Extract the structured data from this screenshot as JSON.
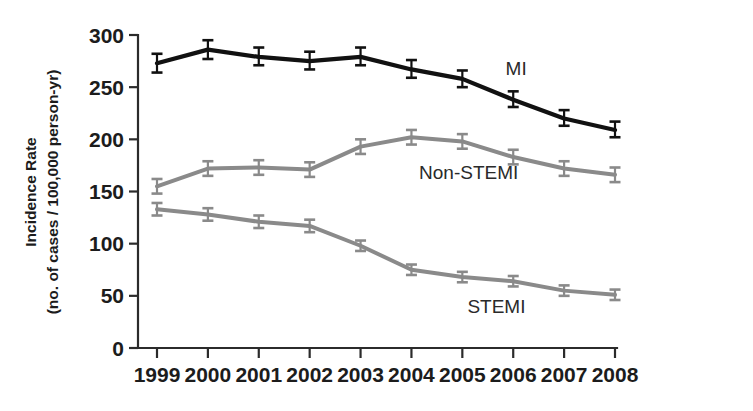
{
  "chart_data": {
    "type": "line",
    "title": "",
    "xlabel": "",
    "ylabel": "Incidence Rate (no. of cases / 100,000 person-yr)",
    "ylabel_line1": "Incidence Rate",
    "ylabel_line2": "(no. of cases / 100,000 person-yr)",
    "categories": [
      "1999",
      "2000",
      "2001",
      "2002",
      "2003",
      "2004",
      "2005",
      "2006",
      "2007",
      "2008"
    ],
    "x": [
      1999,
      2000,
      2001,
      2002,
      2003,
      2004,
      2005,
      2006,
      2007,
      2008
    ],
    "xlim": [
      1999,
      2008
    ],
    "ylim": [
      0,
      300
    ],
    "yticks": [
      0,
      50,
      100,
      150,
      200,
      250,
      300
    ],
    "ytick_labels": [
      "0",
      "50",
      "100",
      "150",
      "200",
      "250",
      "300"
    ],
    "grid": false,
    "legend_position": "inline-annotations",
    "series": [
      {
        "name": "MI",
        "color": "#111111",
        "line_width": 4.2,
        "values": [
          273,
          286,
          279,
          275,
          279,
          267,
          258,
          238,
          220,
          209
        ],
        "error_low": [
          264,
          277,
          271,
          267,
          271,
          259,
          250,
          231,
          213,
          202
        ],
        "error_high": [
          282,
          295,
          288,
          284,
          288,
          276,
          266,
          246,
          228,
          217
        ],
        "label": "MI",
        "label_x": 2005.85,
        "label_y": 262
      },
      {
        "name": "Non-STEMI",
        "color": "#8a8a8a",
        "line_width": 4.0,
        "values": [
          155,
          172,
          173,
          171,
          193,
          202,
          198,
          183,
          172,
          166
        ],
        "error_low": [
          148,
          165,
          166,
          164,
          186,
          195,
          191,
          176,
          165,
          159
        ],
        "error_high": [
          162,
          179,
          180,
          178,
          200,
          209,
          205,
          190,
          179,
          173
        ],
        "label": "Non-STEMI",
        "label_x": 2004.15,
        "label_y": 162
      },
      {
        "name": "STEMI",
        "color": "#8a8a8a",
        "line_width": 4.0,
        "values": [
          133,
          128,
          121,
          117,
          98,
          75,
          68,
          64,
          55,
          51
        ],
        "error_low": [
          127,
          122,
          115,
          111,
          93,
          70,
          63,
          59,
          50,
          46
        ],
        "error_high": [
          139,
          134,
          127,
          123,
          103,
          80,
          73,
          69,
          60,
          56
        ],
        "label": "STEMI",
        "label_x": 2005.1,
        "label_y": 34
      }
    ],
    "annotations": [
      {
        "text": "MI",
        "series": "MI"
      },
      {
        "text": "Non-STEMI",
        "series": "Non-STEMI"
      },
      {
        "text": "STEMI",
        "series": "STEMI"
      }
    ]
  },
  "colors": {
    "axis": "#2b2b2b",
    "text": "#1c1c1c",
    "mi": "#111111",
    "non_stemi": "#8a8a8a",
    "stemi": "#8a8a8a",
    "background": "#ffffff"
  }
}
